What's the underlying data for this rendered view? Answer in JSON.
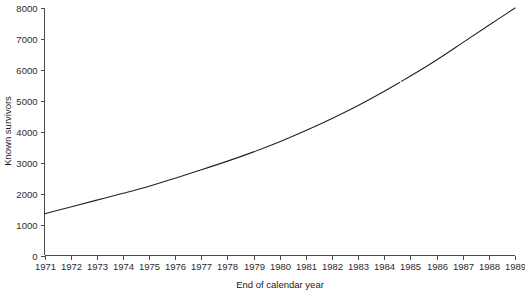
{
  "chart_data": {
    "type": "line",
    "title": "",
    "xlabel": "End of calendar year",
    "ylabel": "Known survivors",
    "xlim": [
      1971,
      1989
    ],
    "ylim": [
      0,
      8000
    ],
    "grid": false,
    "legend": false,
    "series_color": "#222222",
    "x_tick_labels": [
      "1971",
      "1972",
      "1973",
      "1974",
      "1975",
      "1976",
      "1977",
      "1978",
      "1979",
      "1980",
      "1981",
      "1982",
      "1983",
      "1984",
      "1985",
      "1986",
      "1987",
      "1988",
      "1989"
    ],
    "y_tick_labels": [
      "0",
      "1000",
      "2000",
      "3000",
      "4000",
      "5000",
      "6000",
      "7000",
      "8000"
    ],
    "y_ticks": [
      0,
      1000,
      2000,
      3000,
      4000,
      5000,
      6000,
      7000,
      8000
    ],
    "x": [
      1971,
      1972,
      1973,
      1974,
      1975,
      1976,
      1977,
      1978,
      1979,
      1980,
      1981,
      1982,
      1983,
      1984,
      1985,
      1986,
      1987,
      1988,
      1989
    ],
    "values": [
      1350,
      1570,
      1790,
      2010,
      2240,
      2500,
      2770,
      3050,
      3350,
      3680,
      4040,
      4430,
      4850,
      5310,
      5800,
      6320,
      6880,
      7440,
      8000
    ],
    "series": [
      {
        "name": "Known survivors",
        "values": [
          1350,
          1570,
          1790,
          2010,
          2240,
          2500,
          2770,
          3050,
          3350,
          3680,
          4040,
          4430,
          4850,
          5310,
          5800,
          6320,
          6880,
          7440,
          8000
        ]
      }
    ],
    "annotations": [
      {
        "label": "line break",
        "x": 1984.6,
        "y": 5450
      }
    ]
  }
}
